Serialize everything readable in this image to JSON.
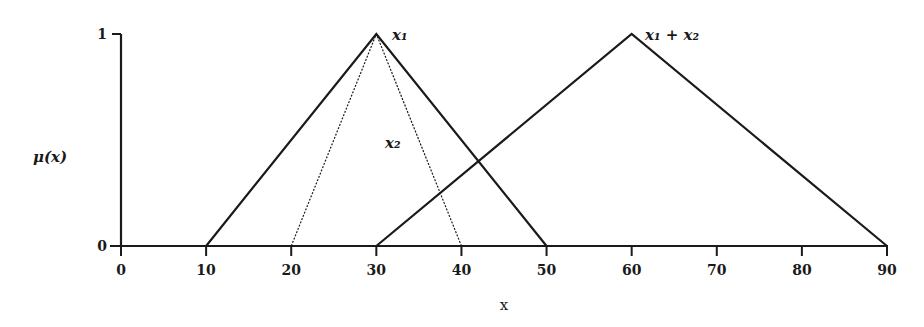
{
  "chart_data": {
    "type": "line",
    "title": "",
    "xlabel": "x",
    "ylabel": "μ(x)",
    "xlim": [
      0,
      90
    ],
    "ylim": [
      0,
      1
    ],
    "x_ticks": [
      "0",
      "10",
      "20",
      "30",
      "40",
      "50",
      "60",
      "70",
      "80",
      "90"
    ],
    "y_ticks": [
      "0",
      "1"
    ],
    "grid": false,
    "legend": "inline labels",
    "series": [
      {
        "name": "x1",
        "label": "x₁",
        "style": "solid",
        "x": [
          10,
          30,
          50
        ],
        "y": [
          0,
          1,
          0
        ]
      },
      {
        "name": "x2",
        "label": "x₂",
        "style": "dotted",
        "x": [
          20,
          30,
          40
        ],
        "y": [
          0,
          1,
          0
        ]
      },
      {
        "name": "x1 + x2",
        "label": "x₁ + x₂",
        "style": "solid",
        "x": [
          30,
          60,
          90
        ],
        "y": [
          0,
          1,
          0
        ]
      }
    ]
  },
  "colors": {
    "line": "#1a1a1a",
    "background": "#ffffff"
  }
}
